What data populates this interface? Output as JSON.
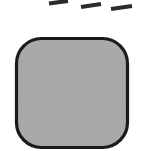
{
  "figure": {
    "title": "Rounded square shape with dashed line segments above",
    "canvas": {
      "width": 146,
      "height": 151,
      "background_color": "#ffffff"
    },
    "shapes": {
      "rounded_square": {
        "label": "rounded-square",
        "x": 16.5,
        "y": 38.5,
        "width": 111,
        "height": 109,
        "corner_radius": 25,
        "fill_color": "#adadad",
        "stroke_color": "#1a1a1a",
        "stroke_width": 3.2
      },
      "dashes": [
        {
          "label": "dash-1",
          "x1": 49,
          "y1": 3.5,
          "x2": 68,
          "y2": 1.0,
          "stroke_color": "#2b2b2b",
          "stroke_width": 4.2
        },
        {
          "label": "dash-2",
          "x1": 81,
          "y1": 7.0,
          "x2": 101,
          "y2": 4.0,
          "stroke_color": "#2b2b2b",
          "stroke_width": 4.2
        },
        {
          "label": "dash-3",
          "x1": 111,
          "y1": 9.0,
          "x2": 132,
          "y2": 6.0,
          "stroke_color": "#2b2b2b",
          "stroke_width": 4.2
        }
      ]
    },
    "noise": {
      "enabled": true,
      "description": "subtle grain texture over the gray fill",
      "opacity": 0.2
    }
  }
}
